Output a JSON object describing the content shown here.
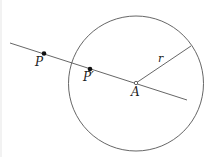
{
  "diagram": {
    "type": "geometry-inversion",
    "colors": {
      "stroke": "#555555",
      "point": "#111111",
      "background": "#ffffff"
    },
    "circle": {
      "cx": 136,
      "cy": 83.5,
      "r": 67.5
    },
    "line": {
      "x1": 10,
      "y1": 43,
      "x2": 187,
      "y2": 100
    },
    "radius_segment": {
      "x1": 136,
      "y1": 83,
      "x2": 191,
      "y2": 46
    },
    "points": [
      {
        "id": "P",
        "label": "P",
        "x": 44,
        "y": 53.5,
        "label_x": 35,
        "label_y": 66
      },
      {
        "id": "P-prime",
        "label": "P′",
        "x": 90,
        "y": 69,
        "label_x": 83,
        "label_y": 81
      },
      {
        "id": "A",
        "label": "A",
        "x": 136,
        "y": 83,
        "label_x": 131,
        "label_y": 96
      }
    ],
    "radius_label": {
      "text": "r",
      "x": 158,
      "y": 62
    }
  }
}
